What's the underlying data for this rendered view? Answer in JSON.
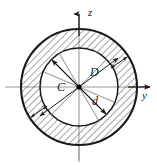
{
  "figure": {
    "kind": "annular-cross-section",
    "background_color": "#ffffff",
    "line_color": "#1a1a1a",
    "hatch_color": "#3a3a3a",
    "axis_color": "#8a8a8a"
  },
  "geometry": {
    "center_x": 79,
    "center_y": 87,
    "outer_radius": 58,
    "inner_radius": 39,
    "hatch_angle_deg": 45,
    "hatch_spacing_px": 5
  },
  "axes": {
    "vertical": {
      "name": "z-axis",
      "label": "z",
      "label_x": 88,
      "label_y": 16,
      "arrow_direction": "up",
      "x": 79,
      "y_top": 10,
      "y_bottom": 162
    },
    "horizontal": {
      "name": "y-axis",
      "label": "y",
      "label_x": 146,
      "label_y": 98,
      "arrow_direction": "right",
      "y": 87,
      "x_left": 5,
      "x_right": 150
    }
  },
  "labels": {
    "centroid": {
      "text": "C",
      "x": 59,
      "y": 88,
      "meaning": "centroid of section"
    },
    "outer_diameter": {
      "text": "D",
      "x": 92,
      "y": 76,
      "meaning": "outer diameter"
    },
    "inner_diameter": {
      "text": "d",
      "x": 93,
      "y": 103,
      "meaning": "inner diameter"
    }
  },
  "dimension_lines": [
    {
      "name": "outer-diameter-arrow",
      "label": "D",
      "angle_deg": 150,
      "spans": "outer-circle",
      "double_headed": true
    },
    {
      "name": "inner-diameter-arrow",
      "label": "d",
      "angle_deg": 225,
      "spans": "inner-circle",
      "double_headed": true
    }
  ],
  "wall_thickness_arrows": [
    {
      "name": "wall-thickness-arrow-upper-right",
      "angle_deg": 35,
      "double_headed": true
    },
    {
      "name": "wall-thickness-arrow-lower-left",
      "angle_deg": 215,
      "double_headed": true
    }
  ]
}
